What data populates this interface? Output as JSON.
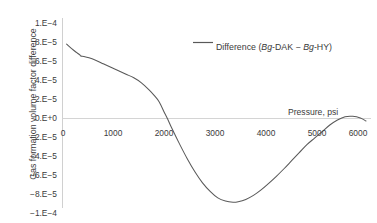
{
  "chart_data": {
    "type": "line",
    "title": "",
    "xlabel": "Pressure, psi",
    "ylabel": "Gas formation volume factor difference",
    "xlim": [
      0,
      6000
    ],
    "ylim": [
      -0.0001,
      0.0001
    ],
    "grid": false,
    "legend_position": "top-center-right",
    "xticks": [
      "0",
      "1000",
      "2000",
      "3000",
      "4000",
      "5000",
      "6000"
    ],
    "xtick_values": [
      0,
      1000,
      2000,
      3000,
      4000,
      5000,
      6000
    ],
    "yticks": [
      "1.E−4",
      "8.E−5",
      "6.E−5",
      "4.E−5",
      "2.E−5",
      "0.E+0",
      "−2.E−5",
      "−4.E−5",
      "−6.E−5",
      "−8.E−5",
      "−1.E−4"
    ],
    "ytick_values": [
      0.0001,
      8e-05,
      6e-05,
      4e-05,
      2e-05,
      0,
      -2e-05,
      -4e-05,
      -6e-05,
      -8e-05,
      -0.0001
    ],
    "series": [
      {
        "name": "Difference (Bg-DAK − Bg-HY)",
        "legend_prefix": "Difference (",
        "legend_italic_1": "Bg",
        "legend_mid_1": "-DAK − ",
        "legend_italic_2": "Bg",
        "legend_suffix": "-HY)",
        "color": "#595959",
        "x": [
          80,
          180,
          280,
          340,
          360,
          420,
          520,
          650,
          800,
          950,
          1100,
          1250,
          1400,
          1550,
          1700,
          1800,
          1900,
          2000,
          2060,
          2150,
          2300,
          2450,
          2600,
          2750,
          2900,
          3050,
          3200,
          3350,
          3450,
          3600,
          3750,
          3900,
          4050,
          4200,
          4350,
          4500,
          4650,
          4800,
          4950,
          5100,
          5250,
          5400,
          5550,
          5700,
          5850,
          5960
        ],
        "y": [
          7.4e-05,
          6.95e-05,
          6.55e-05,
          6.33e-05,
          6.22e-05,
          6.18e-05,
          6.05e-05,
          5.8e-05,
          5.45e-05,
          5.1e-05,
          4.75e-05,
          4.4e-05,
          4.05e-05,
          3.55e-05,
          2.85e-05,
          2.3e-05,
          1.65e-05,
          6e-06,
          0.0,
          -1e-05,
          -2.55e-05,
          -4e-05,
          -5.3e-05,
          -6.4e-05,
          -7.25e-05,
          -7.9e-05,
          -8.22e-05,
          -8.33e-05,
          -8.28e-05,
          -8.05e-05,
          -7.65e-05,
          -7.1e-05,
          -6.45e-05,
          -5.75e-05,
          -5e-05,
          -4.2e-05,
          -3.4e-05,
          -2.6e-05,
          -1.95e-05,
          -1.3e-05,
          -6.5e-06,
          -1.5e-06,
          1.8e-06,
          2.2e-06,
          5e-07,
          -2.5e-06
        ]
      }
    ]
  }
}
